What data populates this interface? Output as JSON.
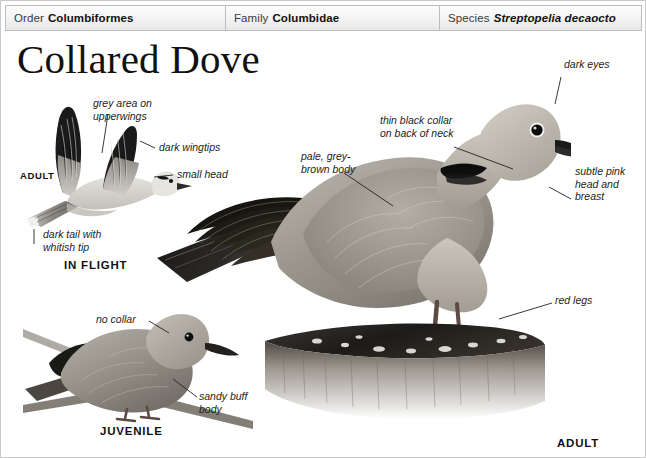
{
  "page": {
    "title": "Collared Dove",
    "border_color": "#c9c9c9",
    "background": "#ffffff"
  },
  "taxonomy": {
    "order": {
      "key": "Order",
      "value": "Columbiformes"
    },
    "family": {
      "key": "Family",
      "value": "Columbidae"
    },
    "species": {
      "key": "Species",
      "value": "Streptopelia decaocto"
    }
  },
  "plates": [
    {
      "id": "flight",
      "label": "ADULT",
      "caption": "IN FLIGHT"
    },
    {
      "id": "juvenile",
      "label": "JUVENILE"
    },
    {
      "id": "adult",
      "label": "ADULT"
    }
  ],
  "plate_labels": {
    "flight_adult": "ADULT",
    "in_flight": "IN FLIGHT",
    "juvenile": "JUVENILE",
    "adult": "ADULT"
  },
  "annotations": {
    "grey_area": "grey area on\nupperwings",
    "dark_wingtips": "dark wingtips",
    "small_head": "small head",
    "dark_tail": "dark tail with\nwhitish tip",
    "no_collar": "no collar",
    "sandy_buff": "sandy buff\nbody",
    "dark_eyes": "dark eyes",
    "thin_black_collar": "thin black collar\non back of neck",
    "pale_grey_brown": "pale, grey-\nbrown body",
    "subtle_pink": "subtle pink\nhead and\nbreast",
    "red_legs": "red legs"
  },
  "colors": {
    "ink": "#1d1d1d",
    "leader": "#222222",
    "bar_border": "#bdbdbd",
    "bar_fill": "#f1f1f1",
    "plumage_light": "#d8d5d0",
    "plumage_mid": "#a9a49d",
    "plumage_dark": "#6f6a63",
    "wingtip_black": "#141414",
    "stump_dark": "#2c2926"
  }
}
